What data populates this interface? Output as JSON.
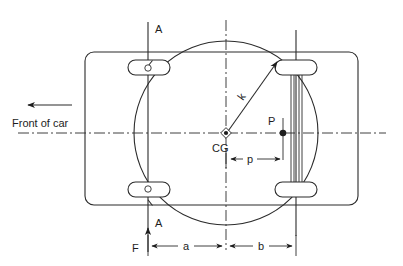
{
  "figure": {
    "kind": "engineering-diagram",
    "background_color": "#ffffff",
    "line_color": "#2b2b2b",
    "width": 403,
    "height": 266
  },
  "labels": {
    "front_of_car": "Front of car",
    "section_top": "A",
    "section_bottom": "A",
    "cg": "CG",
    "point_p": "P",
    "radius_k": "k",
    "dim_p": "p",
    "dim_a": "a",
    "dim_b": "b",
    "force_f": "F"
  },
  "elements": {
    "body_outline": "rounded-rectangle-car-body",
    "gyration_circle": "radius-of-gyration-circle",
    "front_axle_line": "front-axle-section-line",
    "rear_axle_assembly": "rear-axle-multi-line",
    "horizontal_centerline": "longitudinal-centerline",
    "vertical_centerline": "lateral-centerline",
    "wheels": [
      "front-left-wheel",
      "front-right-wheel",
      "rear-left-wheel",
      "rear-right-wheel"
    ],
    "cg_marker": "center-of-gravity-marker",
    "p_marker": "point-p-dot",
    "front_arrow": "front-of-car-direction-arrow",
    "force_arrow": "force-f-arrow",
    "k_arrow": "radius-of-gyration-arrow"
  },
  "geometry": {
    "cg_x": 226,
    "cg_y": 133,
    "circle_radius": 92,
    "front_axle_x": 148,
    "rear_axle_x": 296,
    "p_x": 283,
    "body_left": 85,
    "body_right": 358,
    "body_top": 52,
    "body_bottom": 205
  }
}
